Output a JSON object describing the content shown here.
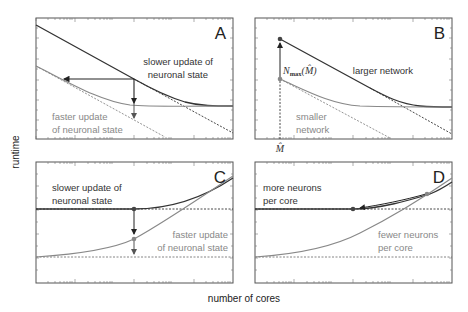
{
  "figure": {
    "ylabel": "runtime",
    "xlabel": "number of cores"
  },
  "panels": [
    {
      "letter": "A",
      "labels": [
        "slower update of",
        "neuronal state",
        "faster update",
        "of neuronal state"
      ]
    },
    {
      "letter": "B",
      "labels": [
        "larger network",
        "smaller",
        "network"
      ],
      "annotation": "N_max(M̂)",
      "annotation_main": "N",
      "annotation_sub": "max",
      "annotation_arg": "(M̂)",
      "x_marker": "M̂"
    },
    {
      "letter": "C",
      "labels": [
        "slower update of",
        "neuronal state",
        "faster update",
        "of neuronal state"
      ]
    },
    {
      "letter": "D",
      "labels": [
        "more neurons",
        "per core",
        "fewer neurons",
        "per core"
      ]
    }
  ],
  "colors": {
    "dark_curve": "#333333",
    "light_curve": "#888888",
    "frame": "#555555"
  }
}
